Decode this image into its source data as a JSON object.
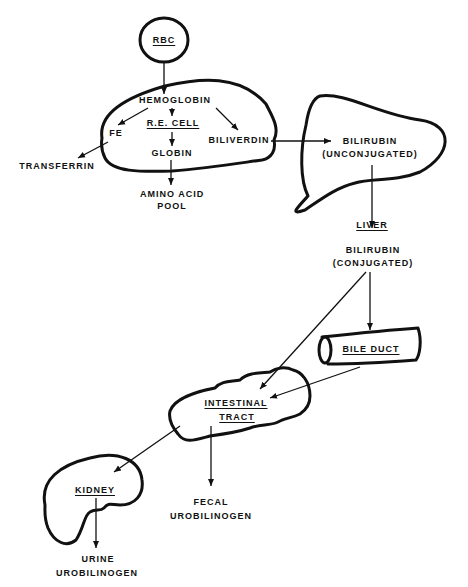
{
  "diagram": {
    "colors": {
      "ink": "#111111",
      "background": "#ffffff"
    },
    "nodes": {
      "rbc": "RBC",
      "hemoglobin": "HEMOGLOBIN",
      "re_cell": "R.E. CELL",
      "fe": "FE",
      "globin": "GLOBIN",
      "biliverdin": "BILIVERDIN",
      "transferrin": "TRANSFERRIN",
      "amino_acid_pool_1": "AMINO ACID",
      "amino_acid_pool_2": "POOL",
      "bilirubin_unconj_1": "BILIRUBIN",
      "bilirubin_unconj_2": "(UNCONJUGATED)",
      "liver": "LIVER",
      "bilirubin_conj_1": "BILIRUBIN",
      "bilirubin_conj_2": "(CONJUGATED)",
      "bile_duct": "BILE DUCT",
      "intestinal_tract_1": "INTESTINAL",
      "intestinal_tract_2": "TRACT",
      "kidney": "KIDNEY",
      "fecal_urobilinogen_1": "FECAL",
      "fecal_urobilinogen_2": "UROBILINOGEN",
      "urine_urobilinogen_1": "URINE",
      "urine_urobilinogen_2": "UROBILINOGEN"
    },
    "edges": [
      [
        "RBC",
        "HEMOGLOBIN"
      ],
      [
        "HEMOGLOBIN",
        "FE"
      ],
      [
        "HEMOGLOBIN",
        "R.E. CELL"
      ],
      [
        "HEMOGLOBIN",
        "BILIVERDIN"
      ],
      [
        "R.E. CELL",
        "GLOBIN"
      ],
      [
        "FE",
        "TRANSFERRIN"
      ],
      [
        "GLOBIN",
        "AMINO ACID POOL"
      ],
      [
        "BILIVERDIN",
        "BILIRUBIN (UNCONJUGATED)"
      ],
      [
        "BILIRUBIN (UNCONJUGATED)",
        "LIVER"
      ],
      [
        "LIVER",
        "BILE DUCT"
      ],
      [
        "LIVER",
        "INTESTINAL TRACT"
      ],
      [
        "BILE DUCT",
        "INTESTINAL TRACT"
      ],
      [
        "INTESTINAL TRACT",
        "KIDNEY"
      ],
      [
        "INTESTINAL TRACT",
        "FECAL UROBILINOGEN"
      ],
      [
        "KIDNEY",
        "URINE UROBILINOGEN"
      ]
    ]
  }
}
